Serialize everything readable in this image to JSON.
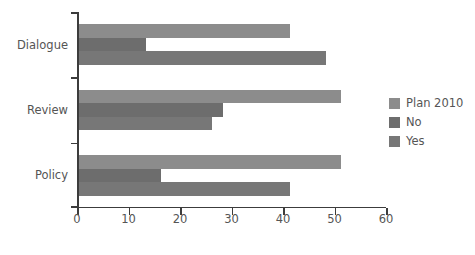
{
  "chart_data": {
    "type": "bar",
    "orientation": "horizontal",
    "title": "",
    "xlabel": "",
    "ylabel": "",
    "categories": [
      "Dialogue",
      "Review",
      "Policy"
    ],
    "series": [
      {
        "name": "Plan 2010",
        "color": "#8c8c8c",
        "values": [
          41,
          51,
          51
        ]
      },
      {
        "name": "No",
        "color": "#6d6d6d",
        "values": [
          13,
          28,
          16
        ]
      },
      {
        "name": "Yes",
        "color": "#777777",
        "values": [
          48,
          26,
          41
        ]
      }
    ],
    "xlim": [
      0,
      60
    ],
    "xticks": [
      0,
      10,
      20,
      30,
      40,
      50,
      60
    ],
    "xtick_labels": [
      "0",
      "10",
      "20",
      "30",
      "40",
      "50",
      "60"
    ],
    "grid": false,
    "legend_position": "right",
    "axis_color": "#3c3c3c",
    "background_color": "#ffffff",
    "text_color": "#555555"
  },
  "legend": {
    "entries": [
      {
        "label": "Plan 2010",
        "color": "#8c8c8c"
      },
      {
        "label": "No",
        "color": "#6d6d6d"
      },
      {
        "label": "Yes",
        "color": "#777777"
      }
    ]
  }
}
